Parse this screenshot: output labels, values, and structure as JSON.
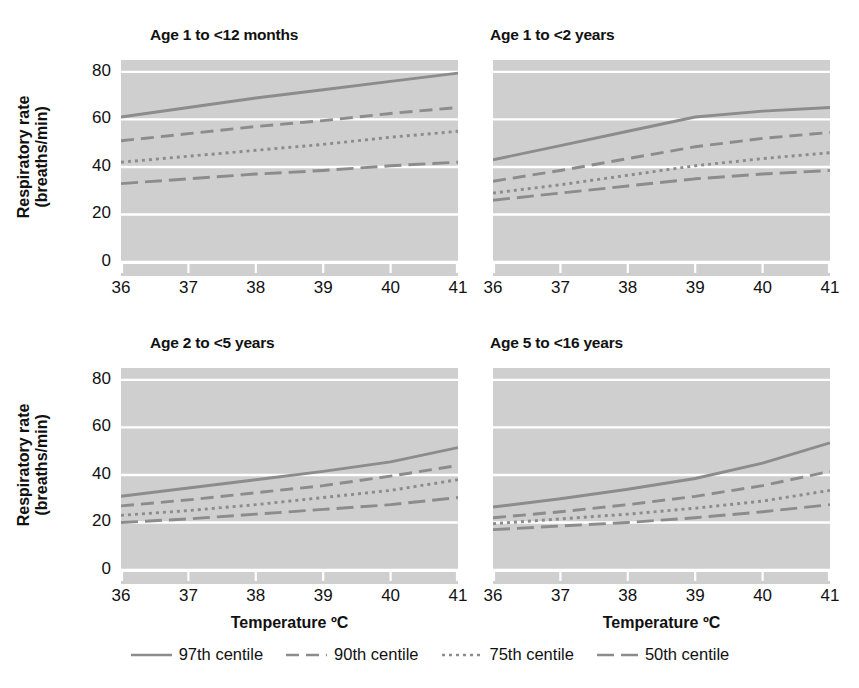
{
  "figure": {
    "y_axis_title_line1": "Respiratory rate",
    "y_axis_title_line2": "(breaths/min)",
    "x_axis_title": "Temperature ºC",
    "plot_bg_color": "#cfcfcf",
    "gridline_color": "#ffffff",
    "line_color": "#8c8c8c",
    "text_color": "#111111"
  },
  "legend": {
    "position": "bottom-center",
    "items": [
      {
        "label": "97th centile",
        "style": "solid",
        "dash": "none"
      },
      {
        "label": "90th centile",
        "style": "dashed",
        "dash": "13,7"
      },
      {
        "label": "75th centile",
        "style": "dotted",
        "dash": "3,4"
      },
      {
        "label": "50th centile",
        "style": "dashdot",
        "dash": "16,6"
      }
    ]
  },
  "chart_data": [
    {
      "type": "line",
      "title": "Age 1 to <12 months",
      "xlabel": "Temperature ºC",
      "ylabel": "Respiratory rate (breaths/min)",
      "xlim": [
        36,
        41
      ],
      "ylim": [
        0,
        85
      ],
      "xticks": [
        36,
        37,
        38,
        39,
        40,
        41
      ],
      "yticks": [
        0,
        20,
        40,
        60,
        80
      ],
      "grid": true,
      "x": [
        36,
        37,
        38,
        39,
        40,
        41
      ],
      "series": [
        {
          "name": "97th centile",
          "style": "solid",
          "values": [
            61,
            65,
            69,
            72.5,
            76,
            79.5
          ]
        },
        {
          "name": "90th centile",
          "style": "dashed",
          "values": [
            51,
            54,
            57,
            59.5,
            62.5,
            65
          ]
        },
        {
          "name": "75th centile",
          "style": "dotted",
          "values": [
            42,
            44.5,
            47,
            49.5,
            52.5,
            55
          ]
        },
        {
          "name": "50th centile",
          "style": "dashdot",
          "values": [
            33,
            35,
            37,
            38.5,
            40.5,
            42
          ]
        }
      ]
    },
    {
      "type": "line",
      "title": "Age 1 to <2 years",
      "xlabel": "Temperature ºC",
      "ylabel": "Respiratory rate (breaths/min)",
      "xlim": [
        36,
        41
      ],
      "ylim": [
        0,
        85
      ],
      "xticks": [
        36,
        37,
        38,
        39,
        40,
        41
      ],
      "yticks": [
        0,
        20,
        40,
        60,
        80
      ],
      "grid": true,
      "x": [
        36,
        37,
        38,
        39,
        40,
        41
      ],
      "series": [
        {
          "name": "97th centile",
          "style": "solid",
          "values": [
            43,
            49,
            55,
            61,
            63.5,
            65
          ]
        },
        {
          "name": "90th centile",
          "style": "dashed",
          "values": [
            34,
            38.5,
            43.5,
            48.5,
            52,
            54.5
          ]
        },
        {
          "name": "75th centile",
          "style": "dotted",
          "values": [
            29,
            32.5,
            36.5,
            40.5,
            43.5,
            46
          ]
        },
        {
          "name": "50th centile",
          "style": "dashdot",
          "values": [
            26,
            29,
            32,
            35,
            37,
            38.5
          ]
        }
      ]
    },
    {
      "type": "line",
      "title": "Age 2 to <5 years",
      "xlabel": "Temperature ºC",
      "ylabel": "Respiratory rate (breaths/min)",
      "xlim": [
        36,
        41
      ],
      "ylim": [
        0,
        85
      ],
      "xticks": [
        36,
        37,
        38,
        39,
        40,
        41
      ],
      "yticks": [
        0,
        20,
        40,
        60,
        80
      ],
      "grid": true,
      "x": [
        36,
        37,
        38,
        39,
        40,
        41
      ],
      "series": [
        {
          "name": "97th centile",
          "style": "solid",
          "values": [
            31,
            34.5,
            38,
            41.5,
            45.5,
            51.5
          ]
        },
        {
          "name": "90th centile",
          "style": "dashed",
          "values": [
            27,
            29.5,
            32.5,
            35.5,
            39.5,
            44
          ]
        },
        {
          "name": "75th centile",
          "style": "dotted",
          "values": [
            23,
            25,
            27.5,
            30.5,
            33.5,
            38
          ]
        },
        {
          "name": "50th centile",
          "style": "dashdot",
          "values": [
            20,
            21.5,
            23.5,
            25.5,
            27.5,
            30.5
          ]
        }
      ]
    },
    {
      "type": "line",
      "title": "Age 5 to <16 years",
      "xlabel": "Temperature ºC",
      "ylabel": "Respiratory rate (breaths/min)",
      "xlim": [
        36,
        41
      ],
      "ylim": [
        0,
        85
      ],
      "xticks": [
        36,
        37,
        38,
        39,
        40,
        41
      ],
      "yticks": [
        0,
        20,
        40,
        60,
        80
      ],
      "grid": true,
      "x": [
        36,
        37,
        38,
        39,
        40,
        41
      ],
      "series": [
        {
          "name": "97th centile",
          "style": "solid",
          "values": [
            26.5,
            30,
            34,
            38.5,
            45,
            53.5
          ]
        },
        {
          "name": "90th centile",
          "style": "dashed",
          "values": [
            22,
            24.5,
            27.5,
            31,
            35.5,
            41.5
          ]
        },
        {
          "name": "75th centile",
          "style": "dotted",
          "values": [
            19.5,
            21.5,
            23.5,
            26,
            29,
            33.5
          ]
        },
        {
          "name": "50th centile",
          "style": "dashdot",
          "values": [
            17,
            18.5,
            20,
            22,
            24.5,
            27.5
          ]
        }
      ]
    }
  ]
}
